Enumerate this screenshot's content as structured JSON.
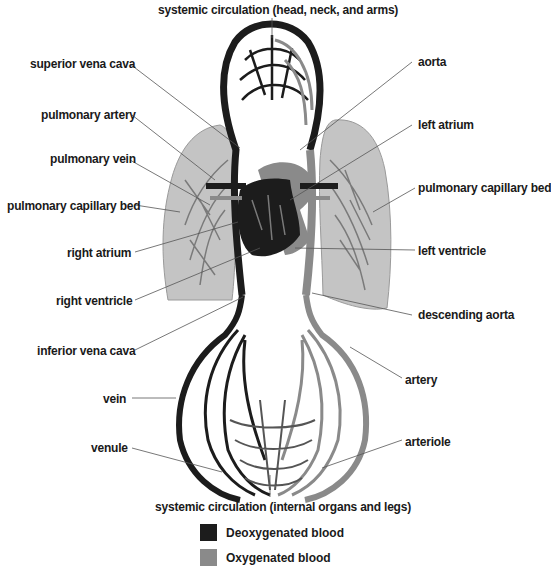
{
  "diagram": {
    "type": "labeled-anatomy",
    "colors": {
      "deoxygenated": "#1c1c1c",
      "oxygenated": "#8a8a8a",
      "lung": "#bdbdbd",
      "leader_line": "#555555"
    },
    "labels": {
      "top": "systemic circulation (head, neck, and arms)",
      "superior_vena_cava": "superior vena cava",
      "pulmonary_artery": "pulmonary artery",
      "pulmonary_vein": "pulmonary vein",
      "pulmonary_capillary_bed_left": "pulmonary capillary bed",
      "right_atrium": "right atrium",
      "right_ventricle": "right ventricle",
      "inferior_vena_cava": "inferior vena cava",
      "vein": "vein",
      "venule": "venule",
      "aorta": "aorta",
      "left_atrium": "left atrium",
      "pulmonary_capillary_bed_right": "pulmonary capillary bed",
      "left_ventricle": "left ventricle",
      "descending_aorta": "descending aorta",
      "artery": "artery",
      "arteriole": "arteriole",
      "bottom": "systemic circulation (internal organs and legs)"
    },
    "legend": [
      {
        "label": "Deoxygenated blood",
        "color": "#1c1c1c"
      },
      {
        "label": "Oxygenated blood",
        "color": "#8a8a8a"
      }
    ]
  }
}
